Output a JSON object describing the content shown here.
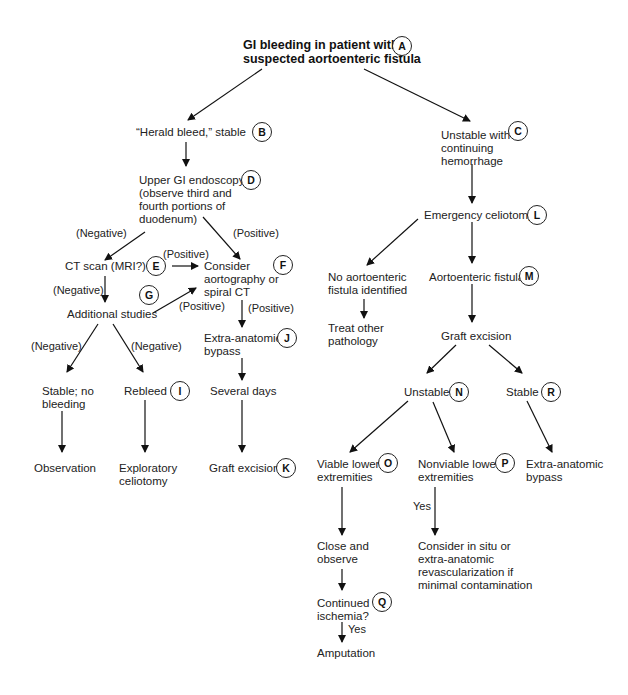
{
  "diagram": {
    "title_line1": "GI bleeding in patient with",
    "title_line2": "suspected aortoenteric fistula",
    "nodes": {
      "A": {
        "badge": "A"
      },
      "B": {
        "line1": "“Herald bleed,” stable",
        "badge": "B"
      },
      "C": {
        "line1": "Unstable with",
        "line2": "continuing",
        "line3": "hemorrhage",
        "badge": "C"
      },
      "D": {
        "line1": "Upper GI endoscopy",
        "line2": "(observe third and",
        "line3": "fourth portions of",
        "line4": "duodenum)",
        "badge": "D"
      },
      "E": {
        "line1": "CT scan (MRI?)",
        "badge": "E"
      },
      "F": {
        "line1": "Consider",
        "line2": "aortography or",
        "line3": "spiral CT",
        "badge": "F"
      },
      "G": {
        "line1": "Additional studies",
        "badge": "G"
      },
      "H": {
        "line1": "Stable; no",
        "line2": "bleeding"
      },
      "I": {
        "line1": "Rebleed",
        "badge": "I"
      },
      "J": {
        "line1": "Extra-anatomic",
        "line2": "bypass",
        "badge": "J"
      },
      "several_days": {
        "line1": "Several days"
      },
      "K": {
        "line1": "Graft excision",
        "badge": "K"
      },
      "observation": {
        "line1": "Observation"
      },
      "exploratory": {
        "line1": "Exploratory",
        "line2": "celiotomy"
      },
      "L": {
        "line1": "Emergency celiotomy",
        "badge": "L"
      },
      "no_fistula": {
        "line1": "No aortoenteric",
        "line2": "fistula identified"
      },
      "treat_other": {
        "line1": "Treat other",
        "line2": "pathology"
      },
      "M": {
        "line1": "Aortoenteric fistula",
        "badge": "M"
      },
      "graft_excision_right": {
        "line1": "Graft excision"
      },
      "N": {
        "line1": "Unstable",
        "badge": "N"
      },
      "R": {
        "line1": "Stable",
        "badge": "R"
      },
      "O": {
        "line1": "Viable lower",
        "line2": "extremities",
        "badge": "O"
      },
      "P": {
        "line1": "Nonviable lower",
        "line2": "extremities",
        "badge": "P"
      },
      "R_out": {
        "line1": "Extra-anatomic",
        "line2": "bypass"
      },
      "close_observe": {
        "line1": "Close and",
        "line2": "observe"
      },
      "consider_insitu": {
        "line1": "Consider in situ or",
        "line2": "extra-anatomic",
        "line3": "revascularization if",
        "line4": "minimal contamination"
      },
      "Q": {
        "line1": "Continued",
        "line2": "ischemia?",
        "badge": "Q"
      },
      "amputation": {
        "line1": "Amputation"
      }
    },
    "edge_labels": {
      "d_neg": "(Negative)",
      "d_pos": "(Positive)",
      "e_pos": "(Positive)",
      "e_neg": "(Negative)",
      "g_pos": "(Positive)",
      "f_pos": "(Positive)",
      "g_neg_left": "(Negative)",
      "g_neg_right": "(Negative)",
      "p_yes": "Yes",
      "q_yes": "Yes"
    }
  }
}
